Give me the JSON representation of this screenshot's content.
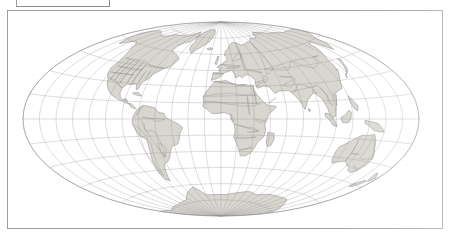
{
  "page": {
    "background_color": "#ffffff",
    "frame_color": "#9d9d9d",
    "cut_off_text": "p    y"
  },
  "table_cell": {
    "label": "",
    "border_color": "#8d8d8d"
  },
  "figure": {
    "name": "world-map",
    "caption": "",
    "frame": {
      "x": 7,
      "y": 10,
      "width": 436,
      "height": 219
    }
  },
  "chart_data": {
    "type": "map",
    "title": "",
    "projection": "Aitoff",
    "projection_family": "pseudoazimuthal equal-area oval",
    "center_longitude": 0,
    "center_latitude": 0,
    "graticule": {
      "visible": true,
      "meridian_interval_deg": 15,
      "parallel_interval_deg": 15,
      "line_color": "#9b9b9b",
      "line_width": 0.35,
      "longitude_range": [
        -180,
        180
      ],
      "latitude_range": [
        -90,
        90
      ]
    },
    "outline": {
      "visible": true,
      "color": "#8a8a8a",
      "line_width": 0.6
    },
    "layers": [
      {
        "name": "ocean",
        "fill": "#ffffff",
        "visible": true
      },
      {
        "name": "land",
        "fill": "#d6d3cc",
        "stroke": "#6f6f6f",
        "visible": true
      },
      {
        "name": "country-boundaries",
        "stroke": "#777777",
        "visible": true
      },
      {
        "name": "state-boundaries",
        "stroke": "#9a9a9a",
        "visible": true
      },
      {
        "name": "coastline",
        "stroke": "#5e5e5e",
        "visible": true
      }
    ],
    "continents_shown": [
      "North America",
      "South America",
      "Europe",
      "Africa",
      "Asia",
      "Australia",
      "Antarctica",
      "Greenland"
    ]
  },
  "map_geometry": {
    "oval_center_x": 220,
    "oval_center_y": 118,
    "oval_radius_x": 205,
    "oval_radius_y": 101
  }
}
